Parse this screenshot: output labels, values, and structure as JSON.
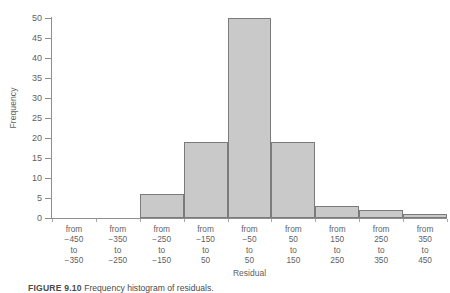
{
  "figure": {
    "caption_number": "FIGURE 9.10",
    "caption_text": "Frequency histogram of residuals.",
    "background": "#ffffff"
  },
  "chart_data": {
    "type": "bar",
    "title": "",
    "xlabel": "Residual",
    "ylabel": "Frequency",
    "categories": [
      "from -450 to -350",
      "from -350 to -250",
      "from -250 to -150",
      "from -150 to 50",
      "from -50 to 50",
      "from 50 to 150",
      "from 150 to 250",
      "from 250 to 350",
      "from 350 to 450"
    ],
    "category_lines": [
      [
        "from",
        "−450",
        "to",
        "−350"
      ],
      [
        "from",
        "−350",
        "to",
        "−250"
      ],
      [
        "from",
        "−250",
        "to",
        "−150"
      ],
      [
        "from",
        "−150",
        "to",
        "50"
      ],
      [
        "from",
        "−50",
        "to",
        "50"
      ],
      [
        "from",
        "50",
        "to",
        "150"
      ],
      [
        "from",
        "150",
        "to",
        "250"
      ],
      [
        "from",
        "250",
        "to",
        "350"
      ],
      [
        "from",
        "350",
        "to",
        "450"
      ]
    ],
    "values": [
      0,
      0,
      6,
      19,
      50,
      19,
      3,
      2,
      1
    ],
    "ylim": [
      0,
      50
    ],
    "yticks": [
      0,
      5,
      10,
      15,
      20,
      25,
      30,
      35,
      40,
      45,
      50
    ],
    "grid": false,
    "legend": false,
    "bar_fill": "#c9c9c9",
    "bar_border": "#7b7b7b",
    "axis_color": "#8e8e8e",
    "text_color": "#5f5f5f"
  }
}
